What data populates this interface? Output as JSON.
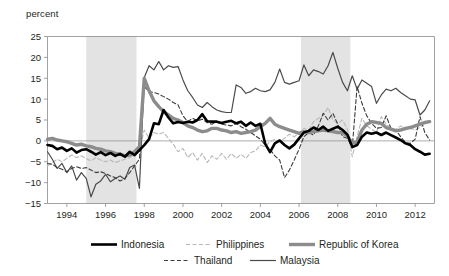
{
  "chart_data": {
    "type": "line",
    "title": "",
    "ylabel": "percent",
    "xlabel": "",
    "ylim": [
      -15,
      25
    ],
    "xlim": [
      1993.0,
      2013.0
    ],
    "yticks": [
      -15,
      -10,
      -5,
      0,
      5,
      10,
      15,
      20,
      25
    ],
    "ytick_labels": [
      "−15",
      "−10",
      "−5",
      "0",
      "5",
      "10",
      "15",
      "20",
      "25"
    ],
    "xticks": [
      1994,
      1996,
      1998,
      2000,
      2002,
      2004,
      2006,
      2008,
      2010,
      2012
    ],
    "xtick_labels": [
      "1994",
      "1996",
      "1998",
      "2000",
      "2002",
      "2004",
      "2006",
      "2008",
      "2010",
      "2012"
    ],
    "grid": false,
    "zero_line": 0,
    "legend_position": "bottom",
    "shaded_bands": [
      {
        "label": "shaded-band-1",
        "x0": 1995.0,
        "x1": 1997.6,
        "color": "#e3e3e3"
      },
      {
        "label": "shaded-band-2",
        "x0": 2006.1,
        "x1": 2008.65,
        "color": "#e3e3e3"
      }
    ],
    "series": [
      {
        "name": "Indonesia",
        "color": "#000000",
        "width": 2.6,
        "dash": "none",
        "x": [
          1993.0,
          1993.25,
          1993.5,
          1993.75,
          1994.0,
          1994.25,
          1994.5,
          1994.75,
          1995.0,
          1995.25,
          1995.5,
          1995.75,
          1996.0,
          1996.25,
          1996.5,
          1996.75,
          1997.0,
          1997.25,
          1997.5,
          1997.75,
          1998.0,
          1998.25,
          1998.5,
          1998.75,
          1999.0,
          1999.25,
          1999.5,
          1999.75,
          2000.0,
          2000.25,
          2000.5,
          2000.75,
          2001.0,
          2001.25,
          2001.5,
          2001.75,
          2002.0,
          2002.25,
          2002.5,
          2002.75,
          2003.0,
          2003.25,
          2003.5,
          2003.75,
          2004.0,
          2004.25,
          2004.5,
          2004.75,
          2005.0,
          2005.25,
          2005.5,
          2005.75,
          2006.0,
          2006.25,
          2006.5,
          2006.75,
          2007.0,
          2007.25,
          2007.5,
          2007.75,
          2008.0,
          2008.25,
          2008.5,
          2008.75,
          2009.0,
          2009.25,
          2009.5,
          2009.75,
          2010.0,
          2010.25,
          2010.5,
          2010.75,
          2011.0,
          2011.25,
          2011.5,
          2011.75,
          2012.0,
          2012.25,
          2012.5,
          2012.75
        ],
        "y": [
          -1.0,
          -1.2,
          -2.0,
          -1.6,
          -2.4,
          -1.8,
          -2.8,
          -2.2,
          -2.0,
          -2.6,
          -3.3,
          -2.7,
          -3.4,
          -2.9,
          -3.6,
          -3.1,
          -3.8,
          -2.6,
          -3.4,
          -2.2,
          -1.0,
          0.4,
          4.2,
          4.0,
          7.4,
          5.6,
          4.2,
          4.5,
          4.3,
          4.6,
          4.4,
          5.0,
          6.4,
          4.7,
          4.6,
          4.6,
          4.3,
          4.6,
          4.8,
          4.2,
          4.6,
          3.6,
          4.4,
          3.6,
          4.1,
          -0.7,
          -2.7,
          -0.6,
          0.1,
          -1.0,
          -1.8,
          -0.9,
          0.6,
          2.0,
          2.4,
          3.2,
          2.6,
          3.4,
          2.4,
          2.9,
          3.4,
          2.6,
          1.5,
          -1.5,
          -1.0,
          1.0,
          2.0,
          1.7,
          2.0,
          1.4,
          2.0,
          1.4,
          0.8,
          0.2,
          -0.6,
          -1.0,
          -2.0,
          -2.6,
          -3.3,
          -3.1
        ]
      },
      {
        "name": "Philippines",
        "color": "#b8b8b8",
        "width": 1.1,
        "dash": "4,2.5",
        "x": [
          1993.0,
          1993.25,
          1993.5,
          1993.75,
          1994.0,
          1994.25,
          1994.5,
          1994.75,
          1995.0,
          1995.25,
          1995.5,
          1995.75,
          1996.0,
          1996.25,
          1996.5,
          1996.75,
          1997.0,
          1997.25,
          1997.5,
          1997.75,
          1998.0,
          1998.25,
          1998.5,
          1998.75,
          1999.0,
          1999.25,
          1999.5,
          1999.75,
          2000.0,
          2000.25,
          2000.5,
          2000.75,
          2001.0,
          2001.25,
          2001.5,
          2001.75,
          2002.0,
          2002.25,
          2002.5,
          2002.75,
          2003.0,
          2003.25,
          2003.5,
          2003.75,
          2004.0,
          2004.25,
          2004.5,
          2004.75,
          2005.0,
          2005.25,
          2005.5,
          2005.75,
          2006.0,
          2006.25,
          2006.5,
          2006.75,
          2007.0,
          2007.25,
          2007.5,
          2007.75,
          2008.0,
          2008.25,
          2008.5,
          2008.75,
          2009.0,
          2009.25,
          2009.5,
          2009.75,
          2010.0,
          2010.25,
          2010.5,
          2010.75,
          2011.0,
          2011.25,
          2011.5,
          2011.75,
          2012.0,
          2012.25,
          2012.5,
          2012.75
        ],
        "y": [
          -6.0,
          -5.2,
          -4.4,
          -5.0,
          -4.2,
          -3.4,
          -4.0,
          -3.6,
          -4.2,
          -4.8,
          -4.0,
          -4.6,
          -5.0,
          -4.6,
          -5.2,
          -4.8,
          -4.4,
          -4.0,
          -3.4,
          -2.4,
          2.6,
          0.6,
          2.0,
          1.6,
          2.0,
          0.6,
          -0.8,
          -2.6,
          -1.8,
          -4.0,
          -2.8,
          -4.6,
          -3.0,
          -5.2,
          -3.6,
          -4.4,
          -3.0,
          -4.4,
          -3.0,
          -4.2,
          -3.2,
          -4.2,
          -2.8,
          -2.4,
          -1.0,
          -1.4,
          -0.2,
          0.4,
          -0.2,
          0.6,
          1.6,
          1.0,
          1.8,
          3.0,
          2.6,
          4.6,
          5.4,
          6.0,
          8.0,
          5.0,
          4.2,
          5.0,
          2.8,
          -3.8,
          1.0,
          5.4,
          3.6,
          2.8,
          2.0,
          5.8,
          4.0,
          3.0,
          2.8,
          3.6,
          2.6,
          3.0,
          2.6,
          3.2,
          4.2,
          4.6
        ]
      },
      {
        "name": "Republic of Korea",
        "color": "#8c8c8c",
        "width": 3.4,
        "dash": "none",
        "x": [
          1993.0,
          1993.25,
          1993.5,
          1993.75,
          1994.0,
          1994.25,
          1994.5,
          1994.75,
          1995.0,
          1995.25,
          1995.5,
          1995.75,
          1996.0,
          1996.25,
          1996.5,
          1996.75,
          1997.0,
          1997.25,
          1997.5,
          1997.75,
          1998.0,
          1998.25,
          1998.5,
          1998.75,
          1999.0,
          1999.25,
          1999.5,
          1999.75,
          2000.0,
          2000.25,
          2000.5,
          2000.75,
          2001.0,
          2001.25,
          2001.5,
          2001.75,
          2002.0,
          2002.25,
          2002.5,
          2002.75,
          2003.0,
          2003.25,
          2003.5,
          2003.75,
          2004.0,
          2004.25,
          2004.5,
          2004.75,
          2005.0,
          2005.25,
          2005.5,
          2005.75,
          2006.0,
          2006.25,
          2006.5,
          2006.75,
          2007.0,
          2007.25,
          2007.5,
          2007.75,
          2008.0,
          2008.25,
          2008.5,
          2008.75,
          2009.0,
          2009.25,
          2009.5,
          2009.75,
          2010.0,
          2010.25,
          2010.5,
          2010.75,
          2011.0,
          2011.25,
          2011.5,
          2011.75,
          2012.0,
          2012.25,
          2012.5,
          2012.75
        ],
        "y": [
          0.4,
          0.6,
          0.2,
          0.0,
          -0.2,
          -0.6,
          -1.0,
          -0.8,
          -1.2,
          -1.4,
          -1.8,
          -2.0,
          -2.4,
          -2.6,
          -3.0,
          -3.2,
          -3.6,
          -3.4,
          -2.6,
          -1.4,
          15.0,
          12.0,
          9.6,
          8.2,
          7.0,
          6.2,
          5.4,
          5.0,
          4.4,
          3.6,
          3.2,
          2.6,
          2.2,
          2.4,
          3.0,
          3.0,
          2.6,
          2.4,
          2.0,
          2.2,
          1.8,
          2.0,
          2.2,
          2.6,
          3.4,
          4.2,
          5.4,
          4.0,
          3.4,
          3.0,
          2.6,
          2.2,
          1.8,
          2.2,
          2.0,
          2.2,
          2.4,
          2.6,
          2.4,
          2.2,
          2.0,
          2.0,
          1.2,
          -0.6,
          -0.2,
          2.6,
          4.0,
          4.6,
          4.4,
          4.2,
          3.2,
          2.8,
          2.4,
          2.6,
          3.0,
          3.2,
          3.6,
          4.0,
          4.4,
          4.6
        ]
      },
      {
        "name": "Thailand",
        "color": "#3c3c3c",
        "width": 1.1,
        "dash": "4,2.5",
        "x": [
          1993.0,
          1993.25,
          1993.5,
          1993.75,
          1994.0,
          1994.25,
          1994.5,
          1994.75,
          1995.0,
          1995.25,
          1995.5,
          1995.75,
          1996.0,
          1996.25,
          1996.5,
          1996.75,
          1997.0,
          1997.25,
          1997.5,
          1997.75,
          1998.0,
          1998.25,
          1998.5,
          1998.75,
          1999.0,
          1999.25,
          1999.5,
          1999.75,
          2000.0,
          2000.25,
          2000.5,
          2000.75,
          2001.0,
          2001.25,
          2001.5,
          2001.75,
          2002.0,
          2002.25,
          2002.5,
          2002.75,
          2003.0,
          2003.25,
          2003.5,
          2003.75,
          2004.0,
          2004.25,
          2004.5,
          2004.75,
          2005.0,
          2005.25,
          2005.5,
          2005.75,
          2006.0,
          2006.25,
          2006.5,
          2006.75,
          2007.0,
          2007.25,
          2007.5,
          2007.75,
          2008.0,
          2008.25,
          2008.5,
          2008.75,
          2009.0,
          2009.25,
          2009.5,
          2009.75,
          2010.0,
          2010.25,
          2010.5,
          2010.75,
          2011.0,
          2011.25,
          2011.5,
          2011.75,
          2012.0,
          2012.25,
          2012.5,
          2012.75
        ],
        "y": [
          -5.4,
          -5.6,
          -6.4,
          -6.8,
          -7.4,
          -6.6,
          -6.2,
          -6.6,
          -6.4,
          -7.0,
          -7.6,
          -7.4,
          -7.8,
          -8.4,
          -8.8,
          -9.6,
          -9.0,
          -7.6,
          -6.0,
          -4.4,
          13.0,
          11.8,
          11.6,
          11.2,
          10.6,
          10.0,
          9.2,
          8.6,
          6.0,
          4.6,
          5.4,
          4.8,
          5.2,
          4.4,
          4.0,
          4.6,
          4.0,
          3.8,
          3.6,
          4.2,
          3.4,
          2.8,
          2.0,
          1.2,
          0.4,
          -1.0,
          -2.0,
          -3.6,
          -4.6,
          -8.8,
          -7.0,
          -4.6,
          -2.0,
          1.0,
          2.0,
          1.4,
          3.6,
          6.6,
          5.0,
          6.6,
          4.0,
          1.0,
          0.6,
          -1.6,
          13.0,
          9.0,
          6.0,
          4.2,
          3.0,
          3.2,
          6.0,
          3.0,
          2.6,
          1.0,
          -0.4,
          -0.6,
          0.4,
          5.8,
          2.0,
          0.2
        ]
      },
      {
        "name": "Malaysia",
        "color": "#4a4a4a",
        "width": 1.2,
        "dash": "none",
        "x": [
          1993.0,
          1993.25,
          1993.5,
          1993.75,
          1994.0,
          1994.25,
          1994.5,
          1994.75,
          1995.0,
          1995.25,
          1995.5,
          1995.75,
          1996.0,
          1996.25,
          1996.5,
          1996.75,
          1997.0,
          1997.25,
          1997.5,
          1997.75,
          1998.0,
          1998.25,
          1998.5,
          1998.75,
          1999.0,
          1999.25,
          1999.5,
          1999.75,
          2000.0,
          2000.25,
          2000.5,
          2000.75,
          2001.0,
          2001.25,
          2001.5,
          2001.75,
          2002.0,
          2002.25,
          2002.5,
          2002.75,
          2003.0,
          2003.25,
          2003.5,
          2003.75,
          2004.0,
          2004.25,
          2004.5,
          2004.75,
          2005.0,
          2005.25,
          2005.5,
          2005.75,
          2006.0,
          2006.25,
          2006.5,
          2006.75,
          2007.0,
          2007.25,
          2007.5,
          2007.75,
          2008.0,
          2008.25,
          2008.5,
          2008.75,
          2009.0,
          2009.25,
          2009.5,
          2009.75,
          2010.0,
          2010.25,
          2010.5,
          2010.75,
          2011.0,
          2011.25,
          2011.5,
          2011.75,
          2012.0,
          2012.25,
          2012.5,
          2012.75
        ],
        "y": [
          -2.6,
          -4.4,
          -6.6,
          -5.4,
          -7.6,
          -6.0,
          -9.4,
          -7.6,
          -9.0,
          -13.4,
          -10.4,
          -9.6,
          -8.0,
          -9.8,
          -9.0,
          -8.4,
          -9.2,
          -6.4,
          -5.8,
          -11.4,
          15.2,
          18.0,
          17.0,
          19.0,
          17.0,
          18.0,
          17.6,
          17.8,
          14.6,
          12.0,
          10.4,
          8.6,
          8.0,
          9.2,
          8.2,
          7.4,
          7.0,
          6.8,
          6.8,
          13.4,
          12.8,
          11.4,
          11.8,
          12.6,
          12.0,
          11.8,
          12.2,
          14.0,
          17.2,
          14.0,
          13.6,
          14.0,
          14.4,
          18.2,
          15.6,
          17.0,
          16.6,
          16.0,
          18.0,
          21.2,
          17.4,
          14.0,
          12.0,
          15.6,
          12.4,
          14.6,
          13.8,
          13.0,
          9.0,
          11.0,
          12.4,
          12.0,
          12.6,
          11.6,
          10.8,
          10.0,
          9.8,
          6.2,
          7.4,
          9.6
        ]
      }
    ]
  },
  "legend": {
    "row1": [
      {
        "name": "Indonesia",
        "swatch": "solid-thick-black"
      },
      {
        "name": "Philippines",
        "swatch": "dashed-light-gray"
      },
      {
        "name": "Republic of Korea",
        "swatch": "solid-thick-gray"
      }
    ],
    "row2": [
      {
        "name": "Thailand",
        "swatch": "dashed-dark-gray"
      },
      {
        "name": "Malaysia",
        "swatch": "solid-thin-gray"
      }
    ]
  },
  "colors": {
    "indonesia": "#000000",
    "philippines": "#b8b8b8",
    "korea": "#8c8c8c",
    "thailand": "#3c3c3c",
    "malaysia": "#4a4a4a",
    "shaded_band": "#e3e3e3",
    "axis": "#8a8a8a",
    "text": "#231f20"
  }
}
